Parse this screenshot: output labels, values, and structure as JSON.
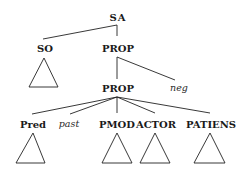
{
  "diagram": {
    "type": "syntax-tree",
    "nodes": {
      "sa": {
        "label": "SA"
      },
      "so": {
        "label": "SO"
      },
      "prop_top": {
        "label": "PROP"
      },
      "prop_mid": {
        "label": "PROP"
      },
      "neg": {
        "label": "neg"
      },
      "pred": {
        "label": "Pred"
      },
      "past": {
        "label": "past"
      },
      "pmod": {
        "label": "PMOD"
      },
      "actor": {
        "label": "ACTOR"
      },
      "patiens": {
        "label": "PATIENS"
      }
    },
    "edges": [
      {
        "from": "SA",
        "to": "SO"
      },
      {
        "from": "SA",
        "to": "PROP"
      },
      {
        "from": "PROP",
        "to": "PROP"
      },
      {
        "from": "PROP",
        "to": "neg"
      },
      {
        "from": "PROP",
        "to": "Pred"
      },
      {
        "from": "PROP",
        "to": "past"
      },
      {
        "from": "PROP",
        "to": "PMOD"
      },
      {
        "from": "PROP",
        "to": "ACTOR"
      },
      {
        "from": "PROP",
        "to": "PATIENS"
      }
    ],
    "collapsed_subtrees": [
      "SO",
      "Pred",
      "PMOD",
      "ACTOR",
      "PATIENS"
    ]
  }
}
